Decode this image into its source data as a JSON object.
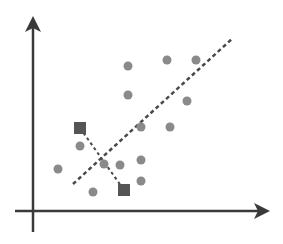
{
  "diagram": {
    "type": "scatter-with-regression-line",
    "colors": {
      "axis": "#3a3a3a",
      "point": "#8a8a8a",
      "highlight": "#555555",
      "line": "#4a4a4a",
      "background": "#ffffff"
    },
    "axes": {
      "x_axis": {
        "from": [
          15,
          211
        ],
        "to": [
          270,
          211
        ]
      },
      "y_axis": {
        "from": [
          33,
          232
        ],
        "to": [
          33,
          16
        ]
      }
    },
    "points": [
      [
        128,
        66
      ],
      [
        167,
        60
      ],
      [
        196,
        60
      ],
      [
        128,
        95
      ],
      [
        187,
        101
      ],
      [
        141,
        127
      ],
      [
        170,
        127
      ],
      [
        80,
        146
      ],
      [
        104,
        164
      ],
      [
        120,
        165
      ],
      [
        141,
        160
      ],
      [
        141,
        181
      ],
      [
        58,
        169
      ],
      [
        93,
        192
      ]
    ],
    "highlighted_points": [
      {
        "center": [
          80,
          128
        ],
        "shape": "square"
      },
      {
        "center": [
          124,
          190
        ],
        "shape": "square"
      }
    ],
    "regression_line": {
      "from": [
        73,
        184
      ],
      "to": [
        233,
        38
      ],
      "style": "dashed"
    },
    "connector_line": {
      "from": [
        80,
        128
      ],
      "to": [
        124,
        190
      ],
      "style": "dashed"
    }
  }
}
